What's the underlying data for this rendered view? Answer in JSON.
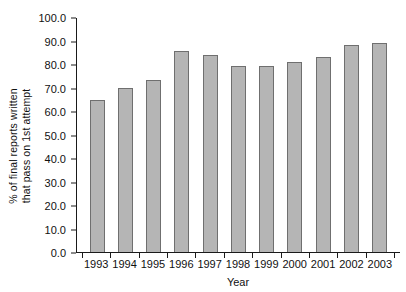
{
  "chart_data": {
    "type": "bar",
    "title": "",
    "xlabel": "Year",
    "ylabel": "% of final reports written\nthat pass on 1st attempt",
    "categories": [
      "1993",
      "1994",
      "1995",
      "1996",
      "1997",
      "1998",
      "1999",
      "2000",
      "2001",
      "2002",
      "2003"
    ],
    "values": [
      64.5,
      70.0,
      73.0,
      85.5,
      84.0,
      79.0,
      79.0,
      81.0,
      83.0,
      88.0,
      89.0
    ],
    "ylim": [
      0.0,
      100.0
    ],
    "ytick_labels": [
      "0.0",
      "10.0",
      "20.0",
      "30.0",
      "40.0",
      "50.0",
      "60.0",
      "70.0",
      "80.0",
      "90.0",
      "100.0"
    ],
    "ytick_values": [
      0,
      10,
      20,
      30,
      40,
      50,
      60,
      70,
      80,
      90,
      100
    ],
    "grid": false,
    "legend": null,
    "bar_color": "#b5b5b5",
    "bar_edge_color": "#6f6f6f",
    "axis_color": "#1a1a1a"
  }
}
